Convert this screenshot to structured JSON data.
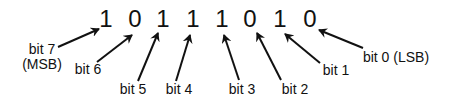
{
  "diagram": {
    "title": "",
    "value_bits": [
      "1",
      "0",
      "1",
      "1",
      "1",
      "0",
      "1",
      "0"
    ],
    "colors": {
      "background": "#ffffff",
      "ink": "#111111"
    },
    "digits": [
      {
        "text": "1",
        "x": 106,
        "y": 7
      },
      {
        "text": "0",
        "x": 135,
        "y": 7
      },
      {
        "text": "1",
        "x": 163,
        "y": 7
      },
      {
        "text": "1",
        "x": 193,
        "y": 7
      },
      {
        "text": "1",
        "x": 222,
        "y": 7
      },
      {
        "text": "0",
        "x": 250,
        "y": 7
      },
      {
        "text": "1",
        "x": 280,
        "y": 7
      },
      {
        "text": "0",
        "x": 310,
        "y": 7
      }
    ],
    "labels": [
      {
        "id": "bit-7",
        "line1": "bit 7",
        "line2": "(MSB)",
        "x": 20,
        "y": 42,
        "w": 44
      },
      {
        "id": "bit-6",
        "line1": "bit 6",
        "line2": "",
        "x": 74,
        "y": 62,
        "w": 28
      },
      {
        "id": "bit-5",
        "line1": "bit 5",
        "line2": "",
        "x": 119,
        "y": 82,
        "w": 28
      },
      {
        "id": "bit-4",
        "line1": "bit 4",
        "line2": "",
        "x": 165,
        "y": 82,
        "w": 28
      },
      {
        "id": "bit-3",
        "line1": "bit 3",
        "line2": "",
        "x": 228,
        "y": 82,
        "w": 28
      },
      {
        "id": "bit-2",
        "line1": "bit 2",
        "line2": "",
        "x": 281,
        "y": 82,
        "w": 28
      },
      {
        "id": "bit-1",
        "line1": "bit 1",
        "line2": "",
        "x": 322,
        "y": 63,
        "w": 28
      },
      {
        "id": "bit-0",
        "line1": "bit 0 (LSB)",
        "line2": "",
        "x": 362,
        "y": 50,
        "w": 68
      }
    ],
    "arrows": [
      {
        "from": "bit-7",
        "x1": 58,
        "y1": 47,
        "x2": 99,
        "y2": 29
      },
      {
        "from": "bit-6",
        "x1": 97,
        "y1": 62,
        "x2": 132,
        "y2": 35
      },
      {
        "from": "bit-5",
        "x1": 138,
        "y1": 81,
        "x2": 158,
        "y2": 33
      },
      {
        "from": "bit-4",
        "x1": 176,
        "y1": 81,
        "x2": 190,
        "y2": 35
      },
      {
        "from": "bit-3",
        "x1": 239,
        "y1": 80,
        "x2": 224,
        "y2": 35
      },
      {
        "from": "bit-2",
        "x1": 281,
        "y1": 80,
        "x2": 257,
        "y2": 33
      },
      {
        "from": "bit-1",
        "x1": 320,
        "y1": 63,
        "x2": 285,
        "y2": 34
      },
      {
        "from": "bit-0",
        "x1": 363,
        "y1": 48,
        "x2": 319,
        "y2": 30
      }
    ]
  }
}
